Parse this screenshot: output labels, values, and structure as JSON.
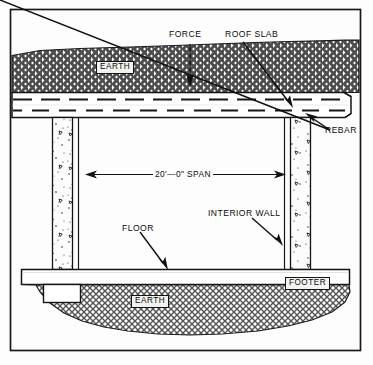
{
  "diagram": {
    "type": "architectural-cross-section",
    "frame": {
      "border_color": "#1a1a1a",
      "background": "#fdfdfd"
    },
    "labels": {
      "force": "FORCE",
      "roof_slab": "ROOF SLAB",
      "rebar": "REBAR",
      "earth_top": "EARTH",
      "earth_bottom": "EARTH",
      "span": "20'—0\" SPAN",
      "floor": "FLOOR",
      "interior_wall": "INTERIOR WALL",
      "footer": "FOOTER"
    },
    "dimensions": {
      "span_feet": 20,
      "span_inches": 0,
      "span_text": "20'—0\" SPAN"
    },
    "elements": [
      {
        "name": "earth-fill-top",
        "label": "EARTH",
        "hatch": "cross-hatch"
      },
      {
        "name": "roof-slab",
        "label": "ROOF SLAB",
        "hatch": "none"
      },
      {
        "name": "rebar",
        "label": "REBAR",
        "hatch": "dashed-lines"
      },
      {
        "name": "interior-wall-left",
        "label": "INTERIOR WALL",
        "hatch": "concrete-speckle"
      },
      {
        "name": "interior-wall-right",
        "label": "INTERIOR WALL",
        "hatch": "concrete-speckle"
      },
      {
        "name": "floor-slab",
        "label": "FLOOR",
        "hatch": "none"
      },
      {
        "name": "footer-left",
        "label": "FOOTER",
        "hatch": "none"
      },
      {
        "name": "footer-right",
        "label": "FOOTER",
        "hatch": "none"
      },
      {
        "name": "earth-fill-bottom",
        "label": "EARTH",
        "hatch": "cross-hatch"
      }
    ],
    "colors": {
      "ink": "#111111",
      "earth_hatch": "#5a5a5a",
      "slab_fill": "#ffffff",
      "concrete_fill": "#fbfbfb",
      "label_box_fill": "#f2f2f0"
    }
  }
}
